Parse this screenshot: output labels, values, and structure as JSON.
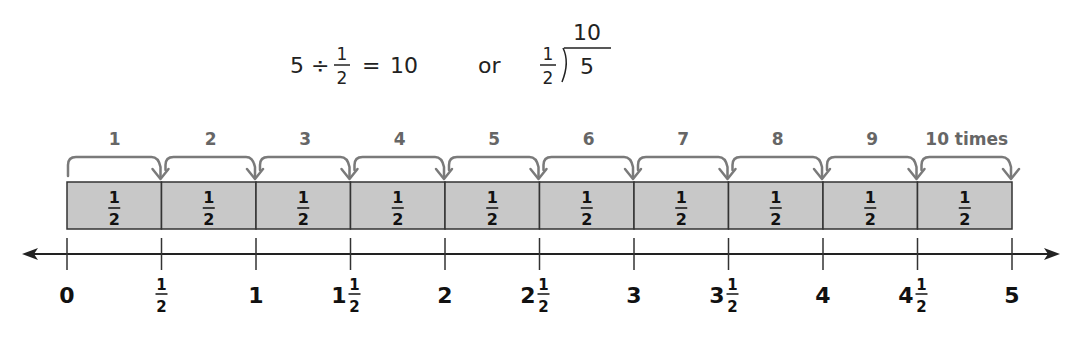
{
  "equation": {
    "dividend": "5",
    "operator": "÷",
    "divisor_numerator": "1",
    "divisor_denominator": "2",
    "equals": "=",
    "result": "10",
    "or_text": "or",
    "long_division": {
      "divisor_numerator": "1",
      "divisor_denominator": "2",
      "dividend": "5",
      "quotient": "10"
    }
  },
  "jumps": {
    "count": 10,
    "labels": [
      "1",
      "2",
      "3",
      "4",
      "5",
      "6",
      "7",
      "8",
      "9",
      "10 times"
    ]
  },
  "segments": {
    "count": 10,
    "numerator": "1",
    "denominator": "2"
  },
  "number_line": {
    "min": 0,
    "max": 5,
    "step": 0.5,
    "ticks": [
      {
        "whole": "0",
        "num": "",
        "den": ""
      },
      {
        "whole": "",
        "num": "1",
        "den": "2"
      },
      {
        "whole": "1",
        "num": "",
        "den": ""
      },
      {
        "whole": "1",
        "num": "1",
        "den": "2"
      },
      {
        "whole": "2",
        "num": "",
        "den": ""
      },
      {
        "whole": "2",
        "num": "1",
        "den": "2"
      },
      {
        "whole": "3",
        "num": "",
        "den": ""
      },
      {
        "whole": "3",
        "num": "1",
        "den": "2"
      },
      {
        "whole": "4",
        "num": "",
        "den": ""
      },
      {
        "whole": "4",
        "num": "1",
        "den": "2"
      },
      {
        "whole": "5",
        "num": "",
        "den": ""
      }
    ]
  },
  "colors": {
    "segment_fill": "#c8c8c8",
    "brace_stroke": "#7a7a7a",
    "label_text": "#666666",
    "line": "#222222"
  }
}
